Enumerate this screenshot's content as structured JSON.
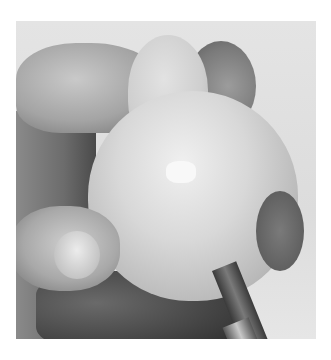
{
  "image": {
    "description": "Grayscale photograph of a hand holding a faceted carved wooden pear while a flat paintbrush is applied to its lower right side",
    "subjects": [
      "hand",
      "carved wooden pear",
      "paintbrush"
    ],
    "colors": {
      "background": "#ffffff",
      "photo_backdrop": "#e0e0e0",
      "pear_light": "#f0f0f0",
      "shadow": "#3a3a3a"
    }
  }
}
